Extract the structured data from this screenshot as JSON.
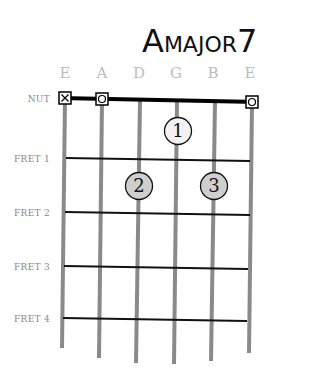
{
  "title": {
    "main_letter": "A",
    "rest": "MAJOR",
    "suffix": "7",
    "full": "A major 7"
  },
  "strings": [
    {
      "label": "E",
      "x": 65,
      "bottom": 348
    },
    {
      "label": "A",
      "x": 102,
      "bottom": 358
    },
    {
      "label": "D",
      "x": 139,
      "bottom": 363
    },
    {
      "label": "G",
      "x": 176,
      "bottom": 364
    },
    {
      "label": "B",
      "x": 213,
      "bottom": 361
    },
    {
      "label": "E",
      "x": 250,
      "bottom": 353
    }
  ],
  "nut": {
    "label": "NUT",
    "y": 99
  },
  "frets": [
    {
      "label": "FRET 1",
      "y": 160
    },
    {
      "label": "FRET 2",
      "y": 214
    },
    {
      "label": "FRET 3",
      "y": 268
    },
    {
      "label": "FRET 4",
      "y": 320
    }
  ],
  "open_string_markers": [
    {
      "string": 1,
      "symbol": "X",
      "meaning": "muted"
    },
    {
      "string": 2,
      "symbol": "O",
      "meaning": "open"
    },
    {
      "string": 6,
      "symbol": "O",
      "meaning": "open"
    }
  ],
  "fingers": [
    {
      "number": "1",
      "string": "G",
      "fret": 1,
      "cx": 178,
      "cy": 131,
      "fill": "#f2f2f2"
    },
    {
      "number": "2",
      "string": "D",
      "fret": 2,
      "cx": 139,
      "cy": 186,
      "fill": "#cfcfcf"
    },
    {
      "number": "3",
      "string": "B",
      "fret": 2,
      "cx": 214,
      "cy": 186,
      "fill": "#cfcfcf"
    }
  ],
  "colors": {
    "string": "#8a8a8a",
    "fret": "#111111",
    "nut": "#000000",
    "string_label": "#bdbdbd",
    "fret_label": "#888888"
  }
}
